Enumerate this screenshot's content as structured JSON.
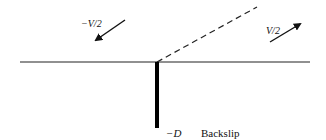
{
  "diagram": {
    "labels": {
      "left_velocity": "−V/2",
      "right_velocity": "V/2",
      "depth": "−D",
      "backslip": "Backslip"
    },
    "colors": {
      "line": "#111111",
      "background": "#ffffff"
    }
  }
}
